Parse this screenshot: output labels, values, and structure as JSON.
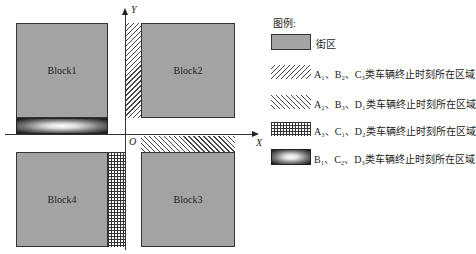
{
  "diagram": {
    "blocks": [
      {
        "id": "block1",
        "label": "Block1"
      },
      {
        "id": "block2",
        "label": "Block2"
      },
      {
        "id": "block3",
        "label": "Block3"
      },
      {
        "id": "block4",
        "label": "Block4"
      }
    ],
    "axes": {
      "x_label": "X",
      "y_label": "Y",
      "origin_label": "O"
    }
  },
  "legend": {
    "title": "图例:",
    "items": [
      {
        "pattern": "solid-gray",
        "text": "街区"
      },
      {
        "pattern": "forward-hatch",
        "text": "A₁、B₂、C₃类车辆终止时刻所在区域"
      },
      {
        "pattern": "backward-hatch",
        "text": "A₂、B₃、D₁类车辆终止时刻所在区域"
      },
      {
        "pattern": "grid",
        "text": "A₃、C₁、D₂类车辆终止时刻所在区域"
      },
      {
        "pattern": "gradient",
        "text": "B₁、C₂、D₃类车辆终止时刻所在区域"
      }
    ]
  },
  "colors": {
    "block": "#a3a3a3",
    "line": "#333333"
  }
}
